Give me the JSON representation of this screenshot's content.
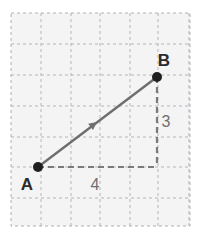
{
  "figure": {
    "canvas": {
      "width": 203,
      "height": 247,
      "background": "#ffffff"
    },
    "grid": {
      "x0": 11,
      "y0": 13,
      "x1": 190,
      "y1": 226,
      "fill": "#f4f4f4",
      "line_color": "#b5b5bd",
      "border_color": "#b0b0b8",
      "columns": 6,
      "rows": 7,
      "vertical_lines": [
        11,
        41,
        71,
        100,
        130,
        158,
        189
      ],
      "horizontal_lines": [
        13,
        44,
        75,
        106,
        137,
        167,
        198,
        226
      ],
      "dash_pattern": "3,3"
    },
    "points": [
      {
        "id": "A",
        "label": "A",
        "x": 38,
        "y": 167,
        "label_x": 27,
        "label_y": 190,
        "dot_radius": 5,
        "color": "#1f1f1f"
      },
      {
        "id": "B",
        "label": "B",
        "x": 157,
        "y": 77,
        "label_x": 164,
        "label_y": 66,
        "dot_radius": 5,
        "color": "#1f1f1f"
      }
    ],
    "vector": {
      "name": "vector-a-to-b",
      "from": "A",
      "to": "B",
      "x1": 38,
      "y1": 167,
      "x2": 157,
      "y2": 77,
      "color": "#6e6e6e",
      "stroke_width": 2.4,
      "arrowhead": {
        "x": 97,
        "y": 122,
        "size": 9
      }
    },
    "legs": [
      {
        "id": "horizontal-leg",
        "name": "horizontal-component",
        "x1": 38,
        "y1": 167,
        "x2": 157,
        "y2": 167,
        "color": "#7a7a7a",
        "stroke_width": 2.2,
        "dash_pattern": "6,4",
        "measure": "4",
        "label_x": 95,
        "label_y": 190
      },
      {
        "id": "vertical-leg",
        "name": "vertical-component",
        "x1": 157,
        "y1": 77,
        "x2": 157,
        "y2": 167,
        "color": "#7a7a7a",
        "stroke_width": 2.2,
        "dash_pattern": "6,4",
        "measure": "3",
        "label_x": 166,
        "label_y": 127
      }
    ]
  },
  "chart_data": {
    "type": "scatter",
    "title": "",
    "xlabel": "",
    "ylabel": "",
    "grid": true,
    "legend": "none",
    "xlim": [
      0,
      6
    ],
    "ylim": [
      0,
      7
    ],
    "points": [
      {
        "label": "A",
        "x": 1,
        "y": 2
      },
      {
        "label": "B",
        "x": 5,
        "y": 5
      }
    ],
    "vectors": [
      {
        "name": "AB",
        "from": "A",
        "to": "B",
        "components": {
          "x": 4,
          "y": 3
        },
        "magnitude": 5
      }
    ],
    "annotations": [
      {
        "text": "A",
        "x": 1,
        "y": 2
      },
      {
        "text": "B",
        "x": 5,
        "y": 5
      },
      {
        "text": "4",
        "x": 3,
        "y": 2
      },
      {
        "text": "3",
        "x": 5,
        "y": 3.5
      }
    ]
  }
}
